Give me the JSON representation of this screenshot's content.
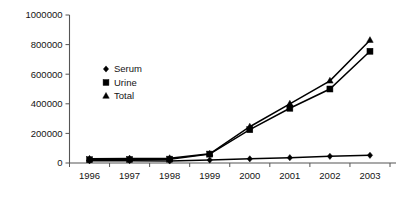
{
  "chart_data": {
    "type": "line",
    "title": "",
    "subtitle": "",
    "xlabel": "",
    "ylabel": "",
    "categories": [
      "1996",
      "1997",
      "1998",
      "1999",
      "2000",
      "2001",
      "2002",
      "2003"
    ],
    "x": [
      1996,
      1997,
      1998,
      1999,
      2000,
      2001,
      2002,
      2003
    ],
    "ylim": [
      0,
      1000000
    ],
    "xlim": [
      "1996",
      "2003"
    ],
    "ytick_labels": [
      "0",
      "200000",
      "400000",
      "600000",
      "800000",
      "1000000"
    ],
    "ytick_values": [
      0,
      200000,
      400000,
      600000,
      800000,
      1000000
    ],
    "grid": false,
    "legend_position": "inside-upper-left",
    "series": [
      {
        "name": "Serum",
        "marker": "diamond",
        "values": [
          15000,
          16000,
          14000,
          20000,
          28000,
          36000,
          45000,
          52000
        ]
      },
      {
        "name": "Urine",
        "marker": "square",
        "values": [
          22000,
          24000,
          26000,
          60000,
          225000,
          370000,
          500000,
          755000
        ]
      },
      {
        "name": "Total",
        "marker": "triangle",
        "values": [
          28000,
          30000,
          32000,
          62000,
          245000,
          400000,
          555000,
          830000
        ]
      }
    ]
  },
  "legend": {
    "items": [
      {
        "label": "Serum",
        "marker": "diamond"
      },
      {
        "label": "Urine",
        "marker": "square"
      },
      {
        "label": "Total",
        "marker": "triangle"
      }
    ]
  },
  "axes": {
    "y_axis_name": "y-axis",
    "x_axis_name": "x-axis"
  }
}
